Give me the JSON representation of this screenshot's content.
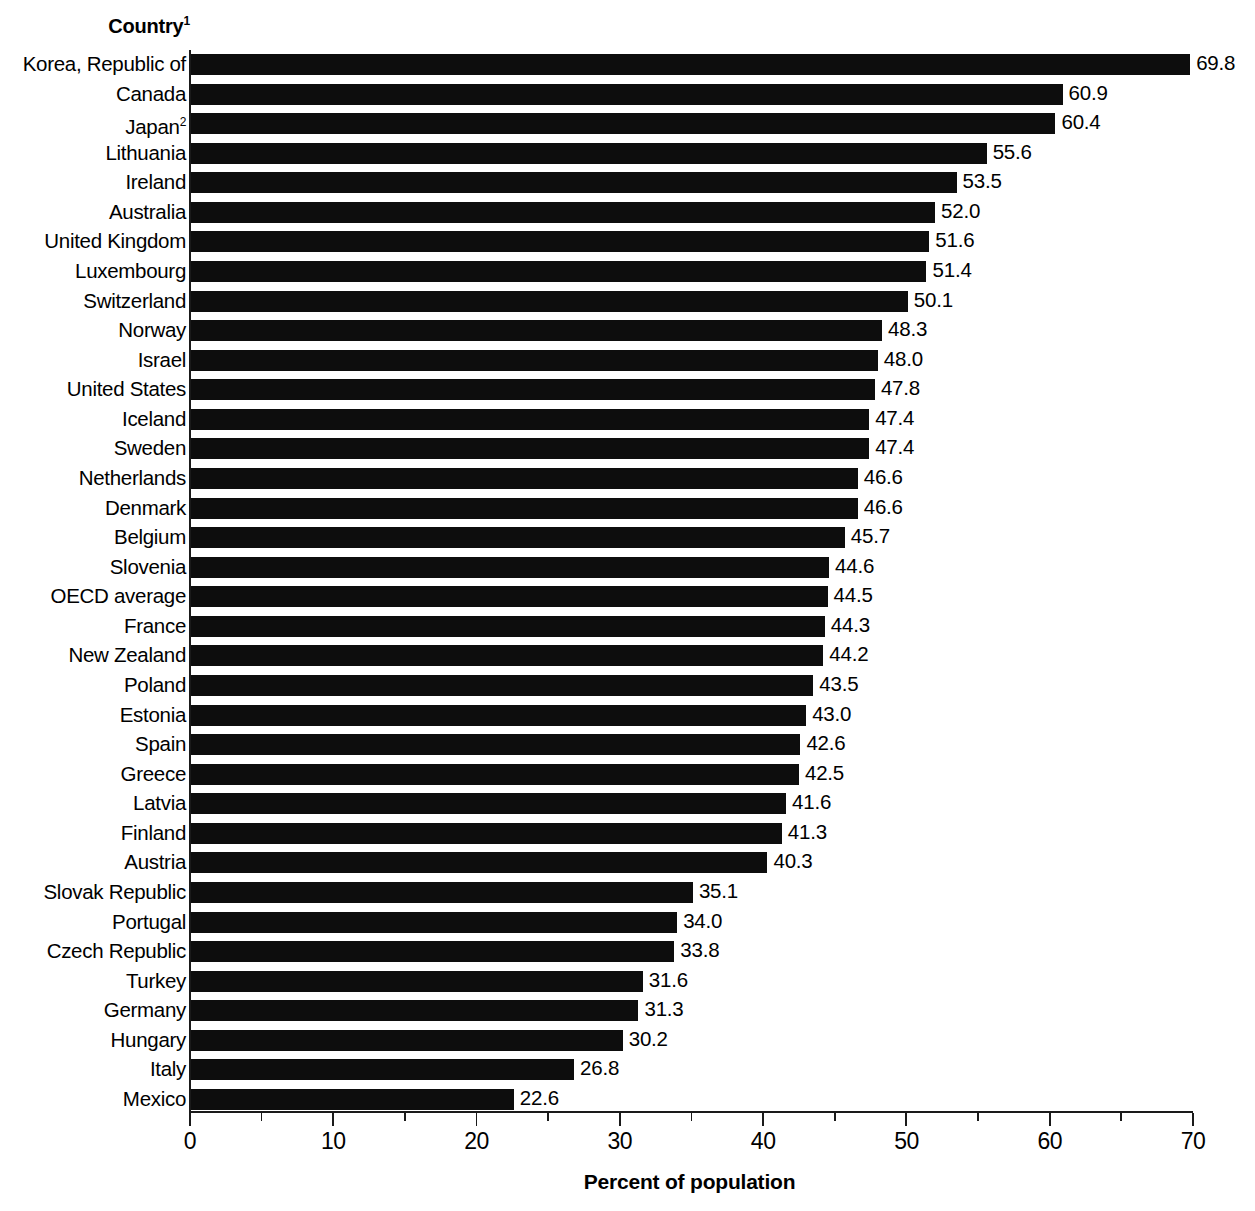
{
  "header": {
    "column_label": "Country",
    "column_label_superscript": "1"
  },
  "axis": {
    "x_title": "Percent of population",
    "tick_labels": [
      "0",
      "10",
      "20",
      "30",
      "40",
      "50",
      "60",
      "70"
    ]
  },
  "chart_data": {
    "type": "bar",
    "orientation": "horizontal",
    "title": "",
    "xlabel": "Percent of population",
    "ylabel": "Country",
    "xlim": [
      0,
      70
    ],
    "xticks": [
      0,
      10,
      20,
      30,
      40,
      50,
      60,
      70
    ],
    "minor_tick_interval": 5,
    "grid": false,
    "legend": null,
    "bar_color": "#0d0d0d",
    "categories": [
      "Korea, Republic of",
      "Canada",
      "Japan",
      "Lithuania",
      "Ireland",
      "Australia",
      "United Kingdom",
      "Luxembourg",
      "Switzerland",
      "Norway",
      "Israel",
      "United States",
      "Iceland",
      "Sweden",
      "Netherlands",
      "Denmark",
      "Belgium",
      "Slovenia",
      "OECD average",
      "France",
      "New Zealand",
      "Poland",
      "Estonia",
      "Spain",
      "Greece",
      "Latvia",
      "Finland",
      "Austria",
      "Slovak Republic",
      "Portugal",
      "Czech Republic",
      "Turkey",
      "Germany",
      "Hungary",
      "Italy",
      "Mexico"
    ],
    "values": [
      69.8,
      60.9,
      60.4,
      55.6,
      53.5,
      52.0,
      51.6,
      51.4,
      50.1,
      48.3,
      48.0,
      47.8,
      47.4,
      47.4,
      46.6,
      46.6,
      45.7,
      44.6,
      44.5,
      44.3,
      44.2,
      43.5,
      43.0,
      42.6,
      42.5,
      41.6,
      41.3,
      40.3,
      35.1,
      34.0,
      33.8,
      31.6,
      31.3,
      30.2,
      26.8,
      22.6
    ],
    "value_labels": [
      "69.8",
      "60.9",
      "60.4",
      "55.6",
      "53.5",
      "52.0",
      "51.6",
      "51.4",
      "50.1",
      "48.3",
      "48.0",
      "47.8",
      "47.4",
      "47.4",
      "46.6",
      "46.6",
      "45.7",
      "44.6",
      "44.5",
      "44.3",
      "44.2",
      "43.5",
      "43.0",
      "42.6",
      "42.5",
      "41.6",
      "41.3",
      "40.3",
      "35.1",
      "34.0",
      "33.8",
      "31.6",
      "31.3",
      "30.2",
      "26.8",
      "22.6"
    ],
    "category_superscripts": {
      "2": "2"
    }
  }
}
